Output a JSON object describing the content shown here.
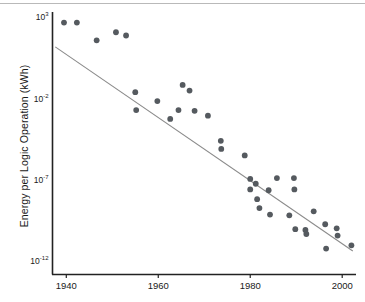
{
  "chart_data": {
    "type": "scatter",
    "title": "",
    "xlabel": "",
    "ylabel": "Energy per Logic Operation (kWh)",
    "xlim": [
      1937,
      2003
    ],
    "ylim_exponent": [
      -12.8,
      3.4
    ],
    "y_scale": "log",
    "grid": false,
    "legend": null,
    "xticks": [
      "1940",
      "1960",
      "1980",
      "2000"
    ],
    "xtick_values": [
      1940,
      1960,
      1980,
      2000
    ],
    "yticks": [
      "10³",
      "10⁻²",
      "10⁻⁷",
      "10⁻¹²"
    ],
    "ytick_exponents": [
      3,
      -2,
      -7,
      -12
    ],
    "series": [
      {
        "name": "Energy per logic operation",
        "marker": "circle",
        "color": "#555a5f",
        "points": [
          {
            "x": 1939.5,
            "y_exponent": 2.75
          },
          {
            "x": 1942.3,
            "y_exponent": 2.75
          },
          {
            "x": 1946.6,
            "y_exponent": 1.65
          },
          {
            "x": 1950.8,
            "y_exponent": 2.15
          },
          {
            "x": 1953.0,
            "y_exponent": 1.95
          },
          {
            "x": 1955.0,
            "y_exponent": -1.55
          },
          {
            "x": 1955.2,
            "y_exponent": -2.65
          },
          {
            "x": 1959.8,
            "y_exponent": -2.1
          },
          {
            "x": 1962.6,
            "y_exponent": -3.2
          },
          {
            "x": 1964.4,
            "y_exponent": -2.65
          },
          {
            "x": 1965.3,
            "y_exponent": -1.1
          },
          {
            "x": 1966.8,
            "y_exponent": -1.45
          },
          {
            "x": 1967.9,
            "y_exponent": -2.7
          },
          {
            "x": 1970.8,
            "y_exponent": -3.0
          },
          {
            "x": 1973.6,
            "y_exponent": -4.55
          },
          {
            "x": 1973.7,
            "y_exponent": -5.05
          },
          {
            "x": 1978.8,
            "y_exponent": -5.45
          },
          {
            "x": 1980.0,
            "y_exponent": -6.9
          },
          {
            "x": 1980.0,
            "y_exponent": -7.55
          },
          {
            "x": 1981.2,
            "y_exponent": -7.2
          },
          {
            "x": 1981.5,
            "y_exponent": -8.15
          },
          {
            "x": 1982.0,
            "y_exponent": -8.7
          },
          {
            "x": 1984.0,
            "y_exponent": -7.6
          },
          {
            "x": 1984.3,
            "y_exponent": -9.1
          },
          {
            "x": 1985.8,
            "y_exponent": -6.85
          },
          {
            "x": 1988.5,
            "y_exponent": -9.15
          },
          {
            "x": 1989.5,
            "y_exponent": -6.85
          },
          {
            "x": 1989.6,
            "y_exponent": -7.55
          },
          {
            "x": 1989.8,
            "y_exponent": -10.0
          },
          {
            "x": 1992.0,
            "y_exponent": -10.05
          },
          {
            "x": 1992.2,
            "y_exponent": -10.3
          },
          {
            "x": 1993.8,
            "y_exponent": -8.9
          },
          {
            "x": 1996.3,
            "y_exponent": -9.7
          },
          {
            "x": 1996.5,
            "y_exponent": -11.2
          },
          {
            "x": 1998.8,
            "y_exponent": -9.95
          },
          {
            "x": 1999.0,
            "y_exponent": -10.4
          },
          {
            "x": 2002.0,
            "y_exponent": -11.0
          }
        ]
      }
    ],
    "trendline": {
      "name": "fit-line",
      "color": "#8b8b8b",
      "x_start": 1937.6,
      "y_exponent_start": 1.25,
      "x_end": 2002.3,
      "y_exponent_end": -11.35
    }
  },
  "axes": {
    "y_title": "Energy per Logic Operation (kWh)"
  }
}
